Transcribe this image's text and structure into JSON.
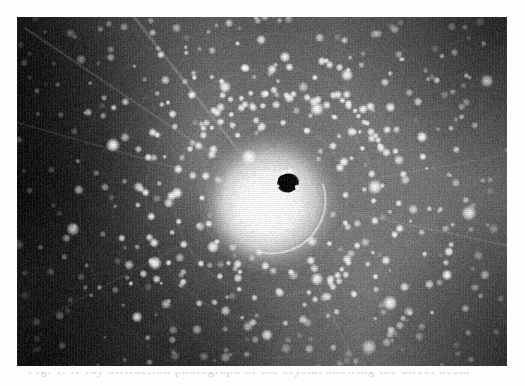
{
  "figure": {
    "kind": "diffraction-pattern-photograph",
    "medium": "grayscale photographic plate",
    "caption_fragment": "Fig. 1.  X-ray diffraction photograph of the crystal showing the direct beam",
    "caption_visibility": "cropped — only the ascender tops of the first line are visible",
    "plate": {
      "left": 17,
      "top": 17,
      "width": 490,
      "height": 349,
      "background_gray": "#787878",
      "corner_vignette_gray": "#141414",
      "page_background": "#fdfdfd"
    },
    "beamstop": {
      "label": "beam stop shadow",
      "center_x": 288,
      "center_y": 183,
      "width": 19,
      "height": 17,
      "color": "#070707"
    },
    "halo": {
      "label": "direct-beam halo",
      "center_x": 274,
      "center_y": 196,
      "radius": 62,
      "core_color": "#f2f2f2",
      "edge_color": "#8a8a8a"
    },
    "rings": [
      {
        "label": "inner ring arc",
        "radius": 74,
        "spot_count": 18
      },
      {
        "label": "middle ring arc",
        "radius": 100,
        "spot_count": 26
      },
      {
        "label": "outer ring arc",
        "radius": 128,
        "spot_count": 30
      }
    ],
    "spots": {
      "label": "Bragg reflection spots",
      "approx_count": 430,
      "color": "#fbfbfb",
      "diameter_min": 2,
      "diameter_max": 5
    },
    "streaks": {
      "label": "radial streak lines",
      "count": 7,
      "color": "#9a9a9a"
    }
  },
  "chart_data": {
    "type": "scatter",
    "subtitle": "",
    "xlabel": "",
    "ylabel": "",
    "xlim": [
      0,
      490
    ],
    "ylim": [
      0,
      349
    ],
    "grid": false,
    "legend": "none",
    "annotations": [
      {
        "text": "direct-beam halo",
        "x": 257,
        "y": 179
      },
      {
        "text": "beam stop shadow",
        "x": 271,
        "y": 166
      }
    ],
    "series": [
      {
        "name": "Bragg reflections",
        "marker": "filled circle",
        "color": "#fbfbfb",
        "note": "positions generated on a quasi-lattice plus concentric ring arcs; see figure.rings and figure.spots"
      }
    ]
  }
}
